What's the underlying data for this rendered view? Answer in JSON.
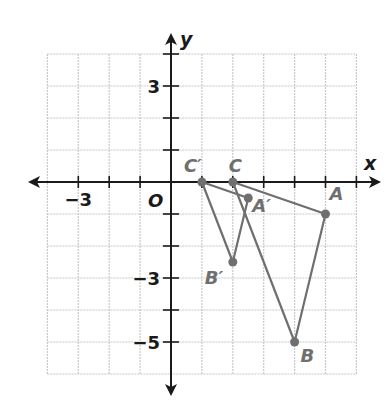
{
  "diagram": {
    "type": "coordinate-plane",
    "grid": {
      "x_min": -4,
      "x_max": 6,
      "y_min": -6,
      "y_max": 4,
      "step": 1
    },
    "axes": {
      "x_label": "x",
      "y_label": "y",
      "origin_label": "O"
    },
    "tick_labels": [
      {
        "axis": "x",
        "value": -3,
        "text": "−3"
      },
      {
        "axis": "y",
        "value": 3,
        "text": "3"
      },
      {
        "axis": "y",
        "value": -3,
        "text": "−3"
      },
      {
        "axis": "y",
        "value": -5,
        "text": "−5"
      }
    ],
    "triangles": [
      {
        "name": "ABC",
        "vertices": [
          {
            "label": "A",
            "x": 5,
            "y": -1
          },
          {
            "label": "B",
            "x": 4,
            "y": -5
          },
          {
            "label": "C",
            "x": 2,
            "y": 0
          }
        ]
      },
      {
        "name": "A'B'C'",
        "vertices": [
          {
            "label": "A′",
            "x": 2.5,
            "y": -0.5
          },
          {
            "label": "B′",
            "x": 2,
            "y": -2.5
          },
          {
            "label": "C′",
            "x": 1,
            "y": 0
          }
        ]
      }
    ],
    "colors": {
      "grid": "#c8c8c8",
      "axis": "#1a1a1a",
      "figure": "#6f6f6f"
    }
  }
}
